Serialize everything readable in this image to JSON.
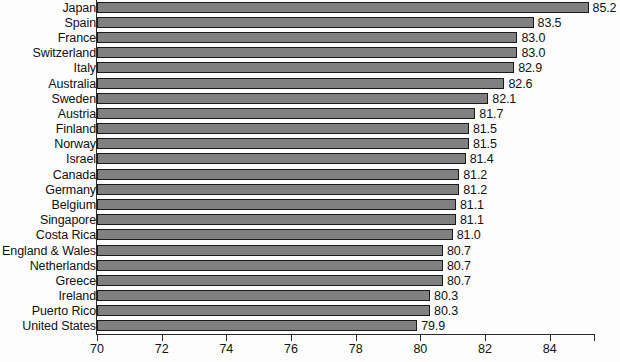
{
  "chart_data": {
    "type": "bar",
    "orientation": "horizontal",
    "title": "",
    "subtitle": "",
    "xlabel": "",
    "ylabel": "",
    "xlim": [
      70,
      85.4
    ],
    "grid": false,
    "legend": null,
    "xticks": [
      70,
      72,
      74,
      76,
      78,
      80,
      82,
      84
    ],
    "xtick_labels": [
      "70",
      "72",
      "74",
      "76",
      "78",
      "80",
      "82",
      "84"
    ],
    "bar_color": "#808080",
    "bar_edge_color": "#1a1a1a",
    "background_color": "#fdfdfd",
    "axis_color": "#2b2b2b",
    "categories": [
      "Japan",
      "Spain",
      "France",
      "Switzerland",
      "Italy",
      "Australia",
      "Sweden",
      "Austria",
      "Finland",
      "Norway",
      "Israel",
      "Canada",
      "Germany",
      "Belgium",
      "Singapore",
      "Costa Rica",
      "England & Wales",
      "Netherlands",
      "Greece",
      "Ireland",
      "Puerto Rico",
      "United States"
    ],
    "values": [
      85.2,
      83.5,
      83.0,
      83.0,
      82.9,
      82.6,
      82.1,
      81.7,
      81.5,
      81.5,
      81.4,
      81.2,
      81.2,
      81.1,
      81.1,
      81.0,
      80.7,
      80.7,
      80.7,
      80.3,
      80.3,
      79.9
    ],
    "value_labels": [
      "85.2",
      "83.5",
      "83.0",
      "83.0",
      "82.9",
      "82.6",
      "82.1",
      "81.7",
      "81.5",
      "81.5",
      "81.4",
      "81.2",
      "81.2",
      "81.1",
      "81.1",
      "81.0",
      "80.7",
      "80.7",
      "80.7",
      "80.3",
      "80.3",
      "79.9"
    ]
  }
}
